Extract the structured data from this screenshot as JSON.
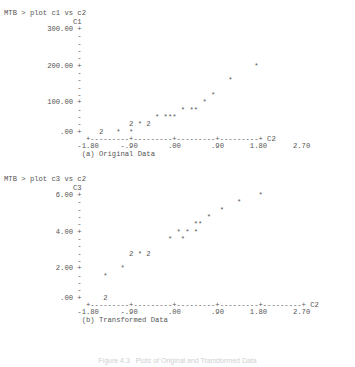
{
  "plot1": {
    "command": "MTB > plot c1 vs c2",
    "lines": [
      "                C1",
      "          300.00 +",
      "                 -",
      "                 -",
      "                 -",
      "                 -",
      "          200.00 +                                        *",
      "                 -",
      "                 -                                  *",
      "                 -",
      "                 -                              *",
      "          100.00 +                            *",
      "                 -                       * **",
      "                 -                 * ***",
      "                 -           2 * 2",
      "             .00 +    2   *  *",
      "                   +---------+---------+---------+---------+ C2",
      "                 -1.80     -.90       .00       .90      1.80      2.70",
      "                  (a) Original Data"
    ]
  },
  "plot2": {
    "command": "MTB > plot c3 vs c2",
    "lines": [
      "                C3",
      "            6.00 +                                         *",
      "                 -                                    *",
      "                 -                                *",
      "                 -                             *",
      "                 -                          **",
      "            4.00 +                      * * *",
      "                 -                    *  *",
      "                 -",
      "                 -           2 * 2",
      "                 -",
      "            2.00 +         *",
      "                 -     *",
      "                 -",
      "                 -",
      "             .00 +     2",
      "                   +---------+---------+---------+---------+---------+ C2",
      "                 -1.80     -.90       .00       .90      1.80      2.70",
      "                  (b) Transformed Data"
    ]
  },
  "footer_caption": "Figure 4.3   Plots of Original and Transformed Data",
  "chart_data": [
    {
      "type": "scatter",
      "title": "(a) Original Data",
      "command": "MTB > plot c1 vs c2",
      "xlabel": "C2",
      "ylabel": "C1",
      "xticks": [
        "-1.80",
        "-.90",
        ".00",
        ".90",
        "1.80",
        "2.70"
      ],
      "yticks": [
        ".00",
        "100.00",
        "200.00",
        "300.00"
      ],
      "xlim": [
        -1.8,
        2.7
      ],
      "ylim": [
        0,
        300
      ],
      "grid": false,
      "points": [
        {
          "x": -1.35,
          "y": 0,
          "count": 2
        },
        {
          "x": -1.05,
          "y": 0
        },
        {
          "x": -0.85,
          "y": 0
        },
        {
          "x": -0.55,
          "y": 12,
          "count": 2
        },
        {
          "x": -0.4,
          "y": 12
        },
        {
          "x": -0.25,
          "y": 12,
          "count": 2
        },
        {
          "x": 0.0,
          "y": 35
        },
        {
          "x": 0.15,
          "y": 35
        },
        {
          "x": 0.22,
          "y": 35
        },
        {
          "x": 0.3,
          "y": 35
        },
        {
          "x": 0.55,
          "y": 58
        },
        {
          "x": 0.72,
          "y": 58
        },
        {
          "x": 0.8,
          "y": 58
        },
        {
          "x": 0.9,
          "y": 75
        },
        {
          "x": 1.2,
          "y": 95
        },
        {
          "x": 1.5,
          "y": 155
        },
        {
          "x": 1.95,
          "y": 220
        }
      ]
    },
    {
      "type": "scatter",
      "title": "(b) Transformed Data",
      "command": "MTB > plot c3 vs c2",
      "xlabel": "C2",
      "ylabel": "C3",
      "xticks": [
        "-1.80",
        "-.90",
        ".00",
        ".90",
        "1.80",
        "2.70"
      ],
      "yticks": [
        ".00",
        "2.00",
        "4.00",
        "6.00"
      ],
      "xlim": [
        -1.8,
        2.7
      ],
      "ylim": [
        0,
        6.5
      ],
      "grid": false,
      "points": [
        {
          "x": -1.35,
          "y": 0.0,
          "count": 2
        },
        {
          "x": -1.0,
          "y": 1.5
        },
        {
          "x": -0.75,
          "y": 1.9
        },
        {
          "x": -0.45,
          "y": 2.5,
          "count": 2
        },
        {
          "x": -0.3,
          "y": 2.4
        },
        {
          "x": -0.15,
          "y": 2.5,
          "count": 2
        },
        {
          "x": 0.05,
          "y": 3.2
        },
        {
          "x": 0.25,
          "y": 3.2
        },
        {
          "x": 0.3,
          "y": 3.5
        },
        {
          "x": 0.42,
          "y": 3.5
        },
        {
          "x": 0.6,
          "y": 3.5
        },
        {
          "x": 0.85,
          "y": 4.0
        },
        {
          "x": 0.98,
          "y": 4.0
        },
        {
          "x": 1.1,
          "y": 4.4
        },
        {
          "x": 1.35,
          "y": 4.9
        },
        {
          "x": 1.55,
          "y": 5.6
        },
        {
          "x": 2.0,
          "y": 6.0
        }
      ]
    }
  ]
}
